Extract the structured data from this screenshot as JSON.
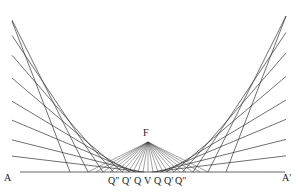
{
  "diagram": {
    "type": "parabola-envelope",
    "colors": {
      "line": "#333333",
      "ray": "#444444",
      "base": "#555555",
      "text": "#222222"
    },
    "labels": {
      "A": "A",
      "A_prime": "A′",
      "F": "F",
      "bottom": [
        "Q″",
        "Q′",
        "Q",
        "V",
        "Q",
        "Q′",
        "Q″"
      ]
    },
    "geometry": {
      "vertex": [
        148,
        172
      ],
      "focus": [
        148,
        142
      ],
      "baseline": {
        "x1": 20,
        "x2": 285,
        "y": 172
      },
      "tangent_slopes": [
        0.12,
        0.25,
        0.42,
        0.6,
        0.85,
        1.15,
        1.5,
        2.0,
        2.6
      ],
      "ray_targets_dx": [
        -60,
        -52,
        -45,
        -38,
        -32,
        -26,
        -20,
        -15,
        -10,
        -5,
        0,
        5,
        10,
        15,
        20,
        26,
        32,
        38,
        45,
        52,
        60
      ]
    }
  }
}
